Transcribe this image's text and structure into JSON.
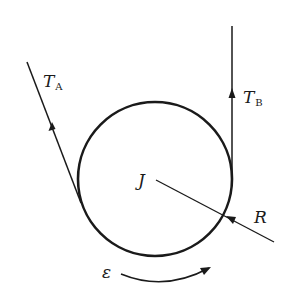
{
  "diagram": {
    "labels": {
      "tension_a": {
        "main": "T",
        "sub": "A"
      },
      "tension_b": {
        "main": "T",
        "sub": "B"
      },
      "inertia": "J",
      "radius": "R",
      "angular_accel": "ε"
    },
    "colors": {
      "stroke": "#1a1a1a",
      "background": "#ffffff"
    }
  }
}
